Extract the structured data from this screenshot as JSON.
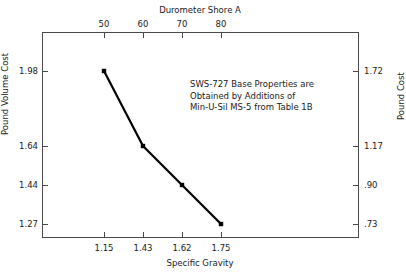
{
  "chart_data": {
    "type": "line",
    "title": "",
    "xlabel": "Specific Gravity",
    "ylabel": "Pound Volume Cost",
    "x2label": "Durometer Shore A",
    "y2label": "Pound Cost",
    "grid": false,
    "legend": "none",
    "x": [
      1.15,
      1.43,
      1.62,
      1.75
    ],
    "values": [
      1.98,
      1.64,
      1.44,
      1.27
    ],
    "series": [
      {
        "name": "Pound Volume Cost vs Specific Gravity",
        "x": [
          1.15,
          1.43,
          1.62,
          1.75
        ],
        "values": [
          1.98,
          1.64,
          1.44,
          1.27
        ],
        "marker": "square",
        "color": "#000000"
      }
    ],
    "x_ticklabels": [
      "1.15",
      "1.43",
      "1.62",
      "1.75"
    ],
    "x2_ticklabels": [
      "50",
      "60",
      "70",
      "80"
    ],
    "y_ticklabels": [
      "1.98",
      "1.64",
      "1.44",
      "1.27"
    ],
    "y2_ticklabels": [
      "1.72",
      "1.17",
      ".90",
      ".73"
    ],
    "x2_values": [
      50,
      60,
      70,
      80
    ],
    "y2_values": [
      1.72,
      1.17,
      0.9,
      0.73
    ],
    "annotation": "SWS-727 Base Properties are Obtained by Additions of Min-U-Sil MS-5 from Table 1B",
    "annotation_lines": [
      "SWS-727 Base Properties are",
      "Obtained by Additions of",
      "Min-U-Sil MS-5 from Table 1B"
    ],
    "xlim": [
      1.0,
      2.05
    ],
    "ylim": [
      1.17,
      2.1
    ],
    "line_color": "#000000",
    "axis_color": "#4a4a4a",
    "background_color": "#ffffff"
  },
  "axes": {
    "top": {
      "title": "Durometer Shore A",
      "ticks": [
        {
          "label": "50",
          "pos": 62
        },
        {
          "label": "60",
          "pos": 101
        },
        {
          "label": "70",
          "pos": 140
        },
        {
          "label": "80",
          "pos": 179
        }
      ]
    },
    "bottom": {
      "title": "Specific Gravity",
      "ticks": [
        {
          "label": "1.15",
          "pos": 62
        },
        {
          "label": "1.43",
          "pos": 101
        },
        {
          "label": "1.62",
          "pos": 140
        },
        {
          "label": "1.75",
          "pos": 179
        }
      ]
    },
    "left": {
      "title": "Pound Volume Cost",
      "ticks": [
        {
          "label": "1.98",
          "pos": 39
        },
        {
          "label": "1.64",
          "pos": 114
        },
        {
          "label": "1.44",
          "pos": 153
        },
        {
          "label": "1.27",
          "pos": 192
        }
      ]
    },
    "right": {
      "title": "Pound Cost",
      "ticks": [
        {
          "label": "1.72",
          "pos": 39
        },
        {
          "label": "1.17",
          "pos": 114
        },
        {
          "label": ".90",
          "pos": 153
        },
        {
          "label": ".73",
          "pos": 192
        }
      ]
    }
  },
  "points": [
    {
      "cx": 62,
      "cy": 39
    },
    {
      "cx": 101,
      "cy": 114
    },
    {
      "cx": 140,
      "cy": 153
    },
    {
      "cx": 179,
      "cy": 192
    }
  ]
}
